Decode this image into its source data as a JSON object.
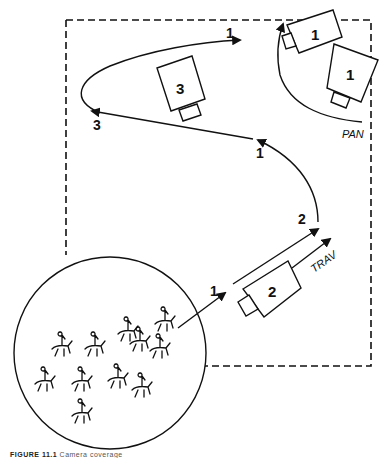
{
  "diagram": {
    "type": "camera-blocking-diagram",
    "cameras": [
      {
        "id": "camera-1a",
        "label": "1"
      },
      {
        "id": "camera-1b",
        "label": "1"
      },
      {
        "id": "camera-2",
        "label": "2"
      },
      {
        "id": "camera-3",
        "label": "3"
      }
    ],
    "path_labels": {
      "start": "1",
      "after_trav": "2",
      "mid": "1",
      "left_turn": "3",
      "end": "1"
    },
    "movements": {
      "trav": "TRAV",
      "pan": "PAN"
    },
    "colors": {
      "ink": "#111111",
      "background": "#ffffff"
    }
  },
  "caption": {
    "prefix": "FIGURE 11.1",
    "text": "Camera coverage"
  }
}
